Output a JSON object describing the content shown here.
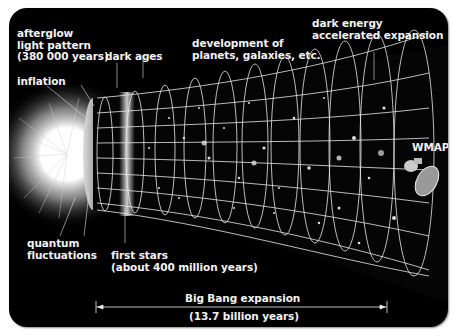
{
  "diagram": {
    "labels": {
      "afterglow": [
        "afterglow",
        "light pattern",
        "(380 000 years)"
      ],
      "dark_ages": "dark ages",
      "development": [
        "development of",
        "planets, galaxies, etc."
      ],
      "dark_energy": [
        "dark energy",
        "accelerated expansion"
      ],
      "inflation": "inflation",
      "wmap": "WMAP",
      "quantum": [
        "quantum",
        "fluctuations"
      ],
      "first_stars": [
        "first stars",
        "(about 400 million years)"
      ],
      "expansion": [
        "Big Bang expansion",
        "(13.7 billion years)"
      ]
    },
    "colors": {
      "background": "#000000",
      "text": "#f2f2f2",
      "grid": "#e8e8e8"
    }
  }
}
